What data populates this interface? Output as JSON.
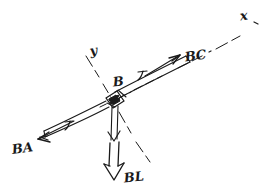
{
  "figure": {
    "kind": "hand-drawn-free-body-diagram",
    "background_color": "#ffffff",
    "ink_color": "#1a1a1a",
    "joint_label": "B",
    "axis_x_label": "x",
    "axis_y_label": "y",
    "force_left_label": "BA",
    "force_left_symbol": "T",
    "force_right_label": "BC",
    "force_right_symbol": "T",
    "load_label": "BL",
    "member_tick_left": "T",
    "member_tick_right": "T"
  },
  "labels": {
    "x_axis": "x",
    "y_axis": "y",
    "joint": "B",
    "tension_ba": "BA",
    "tension_bc": "BC",
    "load_bl": "BL",
    "tension_symbol": "T"
  },
  "colors": {
    "ink": "#1a1a1a",
    "paper": "#ffffff",
    "axis": "#2a2a2a"
  }
}
